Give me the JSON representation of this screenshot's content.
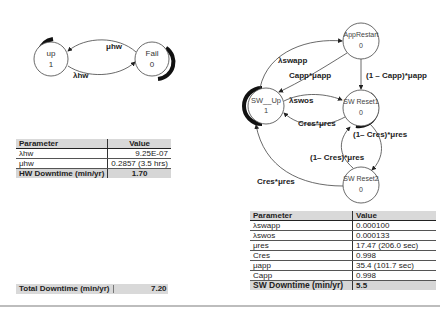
{
  "hw_diagram": {
    "states": [
      {
        "name": "up",
        "value": "1"
      },
      {
        "name": "Fail",
        "value": "0"
      }
    ],
    "transitions": [
      {
        "label": "μhw",
        "from": "Fail",
        "to": "up"
      },
      {
        "label": "λhw",
        "from": "up",
        "to": "Fail"
      }
    ]
  },
  "hw_table": {
    "headers": [
      "Parameter",
      "Value"
    ],
    "rows": [
      {
        "param": "λhw",
        "value": "9.25E-07"
      },
      {
        "param": "μhw",
        "value": "0.2857 (3.5 hrs)"
      }
    ],
    "total": {
      "label": "HW Downtime (min/yr)",
      "value": "1.70"
    }
  },
  "sw_diagram": {
    "states": [
      {
        "name": "AppRestart",
        "value": "0"
      },
      {
        "name": "SW__Up",
        "value": "1"
      },
      {
        "name": "SW Reset1",
        "value": "0"
      },
      {
        "name": "SW Reset2",
        "value": "0"
      }
    ],
    "transitions": [
      {
        "label": "λswapp",
        "from": "SW__Up",
        "to": "AppRestart"
      },
      {
        "label": "Capp*μapp",
        "from": "AppRestart",
        "to": "SW__Up"
      },
      {
        "label": "(1 – Capp)*μapp",
        "from": "AppRestart",
        "to": "SW Reset1"
      },
      {
        "label": "λswos",
        "from": "SW__Up",
        "to": "SW Reset1"
      },
      {
        "label": "Cres*μres",
        "from": "SW Reset1",
        "to": "SW__Up"
      },
      {
        "label": "(1– Cres)*μres",
        "from": "SW Reset1",
        "to": "SW Reset2"
      },
      {
        "label": "(1– Cres)*μres",
        "from": "SW Reset2",
        "to": "SW Reset1"
      },
      {
        "label": "Cres*μres",
        "from": "SW Reset2",
        "to": "SW__Up"
      }
    ]
  },
  "sw_table": {
    "headers": [
      "Parameter",
      "Value"
    ],
    "rows": [
      {
        "param": "λswapp",
        "value": "0.000100"
      },
      {
        "param": "λswos",
        "value": "0.000133"
      },
      {
        "param": "μres",
        "value": "17.47 (206.0 sec)"
      },
      {
        "param": "Cres",
        "value": "0.998"
      },
      {
        "param": "μapp",
        "value": "35.4 (101.7 sec)"
      },
      {
        "param": "Capp",
        "value": "0.998"
      }
    ],
    "total": {
      "label": "SW Downtime (min/yr)",
      "value": "5.5"
    }
  },
  "total_downtime": {
    "label": "Total Downtime (min/yr)",
    "value": "7.20"
  }
}
